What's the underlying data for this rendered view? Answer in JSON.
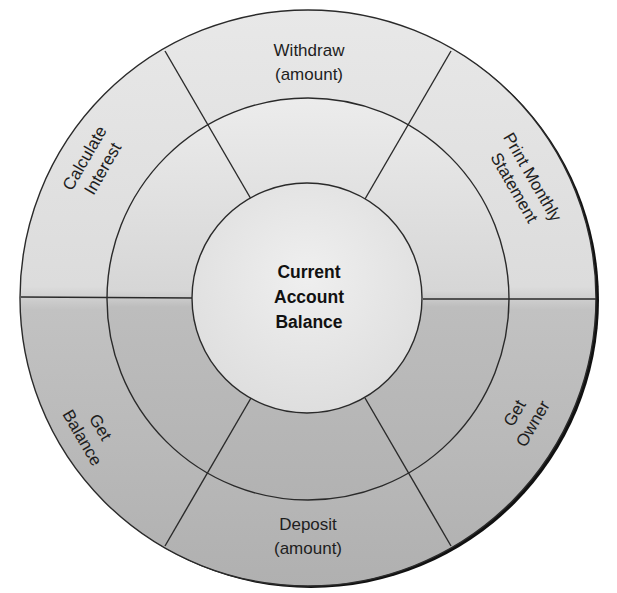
{
  "diagram": {
    "title": "Current Account Balance",
    "center": {
      "lines": [
        "Current",
        "Account",
        "Balance"
      ]
    },
    "operations": [
      {
        "id": "withdraw",
        "lines": [
          "Withdraw",
          "(amount)"
        ]
      },
      {
        "id": "print-monthly-statement",
        "lines": [
          "Print Monthly",
          "Statement"
        ]
      },
      {
        "id": "get-owner",
        "lines": [
          "Get",
          "Owner"
        ]
      },
      {
        "id": "deposit",
        "lines": [
          "Deposit",
          "(amount)"
        ]
      },
      {
        "id": "get-balance",
        "lines": [
          "Get",
          "Balance"
        ]
      },
      {
        "id": "calculate-interest",
        "lines": [
          "Calculate",
          "Interest"
        ]
      }
    ],
    "colors": {
      "top_fill": "#e6e6e6",
      "bottom_fill": "#b5b5b5",
      "center_fill": "#ebebeb",
      "line": "#2a2a2a",
      "shadow": "#111111"
    }
  }
}
